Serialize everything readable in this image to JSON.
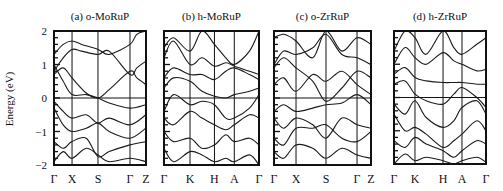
{
  "figure": {
    "ylabel": "Energy (eV)",
    "yticks": [
      {
        "value": 2,
        "label": "2"
      },
      {
        "value": 1,
        "label": "1"
      },
      {
        "value": 0,
        "label": "0"
      },
      {
        "value": -1,
        "label": "-1"
      },
      {
        "value": -2,
        "label": "-2"
      }
    ],
    "ylim": [
      -2,
      2
    ],
    "colors": {
      "line": "#1a1a1a",
      "frame": "#111111",
      "background": "#ffffff"
    }
  },
  "chart_data": [
    {
      "type": "line",
      "title": "(a) o-MoRuP",
      "xlabel": "",
      "ylabel": "Energy (eV)",
      "ylim": [
        -2,
        2
      ],
      "grid": false,
      "fermi_level": 0,
      "x_ticks": [
        "Γ",
        "X",
        "S",
        "Γ",
        "Z"
      ],
      "x_tick_positions": [
        0,
        0.196,
        0.478,
        0.826,
        1.0
      ],
      "series": [
        {
          "name": "band1",
          "x": [
            0,
            0.1,
            0.196,
            0.3,
            0.478,
            0.6,
            0.826,
            0.9,
            1
          ],
          "y": [
            1.3,
            1.6,
            1.7,
            1.6,
            1.45,
            1.3,
            1.6,
            1.9,
            2.0
          ]
        },
        {
          "name": "band2",
          "x": [
            0,
            0.1,
            0.196,
            0.3,
            0.478,
            0.6,
            0.826,
            0.9,
            1
          ],
          "y": [
            0.8,
            1.2,
            1.45,
            1.4,
            1.3,
            1.4,
            0.7,
            0.9,
            1.1
          ]
        },
        {
          "name": "band3",
          "x": [
            0,
            0.1,
            0.196,
            0.35,
            0.478,
            0.6,
            0.826,
            0.9,
            1
          ],
          "y": [
            0.7,
            0.9,
            0.6,
            0.15,
            0.0,
            0.25,
            0.8,
            0.6,
            0.4
          ]
        },
        {
          "name": "band4",
          "x": [
            0,
            0.1,
            0.196,
            0.35,
            0.478,
            0.6,
            0.826,
            1
          ],
          "y": [
            1.0,
            0.5,
            0.1,
            0.1,
            0.0,
            -0.15,
            -0.3,
            -0.2
          ]
        },
        {
          "name": "band5",
          "x": [
            0,
            0.1,
            0.196,
            0.35,
            0.478,
            0.6,
            0.826,
            1
          ],
          "y": [
            -0.1,
            -0.4,
            -0.6,
            -0.5,
            -0.75,
            -0.6,
            -0.8,
            -0.5
          ]
        },
        {
          "name": "band6",
          "x": [
            0,
            0.1,
            0.196,
            0.35,
            0.478,
            0.6,
            0.826,
            1
          ],
          "y": [
            -0.3,
            -0.8,
            -1.0,
            -0.9,
            -0.75,
            -1.0,
            -1.2,
            -0.9
          ]
        },
        {
          "name": "band7",
          "x": [
            0,
            0.1,
            0.196,
            0.35,
            0.478,
            0.6,
            0.826,
            1
          ],
          "y": [
            -1.3,
            -1.5,
            -1.3,
            -1.2,
            -1.75,
            -1.6,
            -1.4,
            -1.3
          ]
        },
        {
          "name": "band8",
          "x": [
            0,
            0.1,
            0.196,
            0.35,
            0.478,
            0.6,
            0.826,
            1
          ],
          "y": [
            -1.9,
            -1.6,
            -1.8,
            -1.5,
            -1.7,
            -1.9,
            -1.8,
            -1.9
          ]
        }
      ]
    },
    {
      "type": "line",
      "title": "(b) h-MoRuP",
      "xlabel": "",
      "ylabel": "",
      "ylim": [
        -2,
        2
      ],
      "grid": false,
      "fermi_level": 0,
      "x_ticks": [
        "Γ",
        "K",
        "H",
        "A",
        "Γ"
      ],
      "x_tick_positions": [
        0,
        0.274,
        0.531,
        0.74,
        1.0
      ],
      "series": [
        {
          "name": "band1",
          "x": [
            0,
            0.1,
            0.274,
            0.4,
            0.531,
            0.65,
            0.74,
            0.9,
            1
          ],
          "y": [
            1.5,
            1.8,
            1.4,
            2.0,
            1.6,
            1.2,
            1.0,
            1.4,
            2.0
          ]
        },
        {
          "name": "band2",
          "x": [
            0,
            0.1,
            0.274,
            0.4,
            0.531,
            0.65,
            0.74,
            0.9,
            1
          ],
          "y": [
            1.2,
            1.7,
            1.0,
            1.2,
            0.95,
            1.05,
            0.95,
            0.8,
            0.7
          ]
        },
        {
          "name": "band3",
          "x": [
            0,
            0.1,
            0.274,
            0.4,
            0.531,
            0.65,
            0.74,
            0.9,
            1
          ],
          "y": [
            0.6,
            0.9,
            0.7,
            0.7,
            0.55,
            0.8,
            0.9,
            0.7,
            0.55
          ]
        },
        {
          "name": "band4",
          "x": [
            0,
            0.1,
            0.274,
            0.4,
            0.531,
            0.65,
            0.74,
            0.9,
            1
          ],
          "y": [
            0.3,
            0.6,
            0.5,
            0.2,
            0.05,
            0.0,
            0.1,
            0.2,
            0.3
          ]
        },
        {
          "name": "band5",
          "x": [
            0,
            0.1,
            0.274,
            0.4,
            0.531,
            0.65,
            0.74,
            0.9,
            1
          ],
          "y": [
            -0.4,
            0.1,
            -0.2,
            -0.1,
            -0.2,
            -0.6,
            -0.6,
            -0.3,
            0.1
          ]
        },
        {
          "name": "band6",
          "x": [
            0,
            0.1,
            0.274,
            0.4,
            0.531,
            0.65,
            0.74,
            0.9,
            1
          ],
          "y": [
            -0.6,
            -0.8,
            -0.4,
            -0.6,
            -0.8,
            -0.95,
            -0.8,
            -0.5,
            -0.6
          ]
        },
        {
          "name": "band7",
          "x": [
            0,
            0.1,
            0.274,
            0.4,
            0.531,
            0.65,
            0.74,
            0.9,
            1
          ],
          "y": [
            -1.0,
            -1.3,
            -1.2,
            -1.5,
            -1.4,
            -1.1,
            -1.3,
            -1.2,
            -1.4
          ]
        },
        {
          "name": "band8",
          "x": [
            0,
            0.1,
            0.274,
            0.4,
            0.531,
            0.65,
            0.74,
            0.9,
            1
          ],
          "y": [
            -1.5,
            -1.9,
            -1.6,
            -1.7,
            -1.9,
            -1.8,
            -1.9,
            -1.7,
            -2.0
          ]
        }
      ]
    },
    {
      "type": "line",
      "title": "(c) o-ZrRuP",
      "xlabel": "",
      "ylabel": "",
      "ylim": [
        -2,
        2
      ],
      "grid": false,
      "fermi_level": 0,
      "x_ticks": [
        "Γ",
        "X",
        "S",
        "Γ",
        "Z"
      ],
      "x_tick_positions": [
        0,
        0.227,
        0.536,
        0.856,
        1.0
      ],
      "series": [
        {
          "name": "band1",
          "x": [
            0,
            0.1,
            0.227,
            0.4,
            0.536,
            0.7,
            0.856,
            1
          ],
          "y": [
            1.8,
            1.9,
            1.7,
            1.2,
            2.0,
            1.4,
            1.8,
            1.6
          ]
        },
        {
          "name": "band2",
          "x": [
            0,
            0.1,
            0.227,
            0.4,
            0.536,
            0.7,
            0.856,
            1
          ],
          "y": [
            1.0,
            1.4,
            1.3,
            1.5,
            1.9,
            1.3,
            1.2,
            1.0
          ]
        },
        {
          "name": "band3",
          "x": [
            0,
            0.1,
            0.227,
            0.4,
            0.536,
            0.7,
            0.856,
            1
          ],
          "y": [
            0.9,
            1.2,
            0.9,
            0.5,
            -0.1,
            0.3,
            0.8,
            0.6
          ]
        },
        {
          "name": "band4",
          "x": [
            0,
            0.1,
            0.227,
            0.4,
            0.536,
            0.7,
            0.856,
            1
          ],
          "y": [
            0.4,
            0.6,
            0.2,
            0.7,
            0.5,
            0.8,
            0.4,
            0.1
          ]
        },
        {
          "name": "band5",
          "x": [
            0,
            0.1,
            0.227,
            0.4,
            0.536,
            0.7,
            0.856,
            1
          ],
          "y": [
            -0.4,
            -0.2,
            -0.4,
            -0.3,
            -0.2,
            -0.15,
            0.1,
            -0.2
          ]
        },
        {
          "name": "band6",
          "x": [
            0,
            0.1,
            0.227,
            0.4,
            0.536,
            0.7,
            0.856,
            1
          ],
          "y": [
            -0.6,
            -0.9,
            -0.6,
            -0.8,
            -1.2,
            -0.6,
            -0.8,
            -0.9
          ]
        },
        {
          "name": "band7",
          "x": [
            0,
            0.1,
            0.227,
            0.4,
            0.536,
            0.7,
            0.856,
            1
          ],
          "y": [
            -1.2,
            -1.4,
            -0.9,
            -0.9,
            -0.8,
            -1.2,
            -1.3,
            -1.0
          ]
        },
        {
          "name": "band8",
          "x": [
            0,
            0.1,
            0.227,
            0.4,
            0.536,
            0.7,
            0.856,
            1
          ],
          "y": [
            -1.6,
            -1.8,
            -1.4,
            -1.5,
            -1.8,
            -1.5,
            -1.7,
            -1.8
          ]
        }
      ]
    },
    {
      "type": "line",
      "title": "(d) h-ZrRuP",
      "xlabel": "",
      "ylabel": "",
      "ylim": [
        -2,
        2
      ],
      "grid": false,
      "fermi_level": 0,
      "x_ticks": [
        "Γ",
        "K",
        "H",
        "A",
        "Γ"
      ],
      "x_tick_positions": [
        0,
        0.228,
        0.533,
        0.739,
        1.0
      ],
      "series": [
        {
          "name": "band1",
          "x": [
            0,
            0.12,
            0.228,
            0.35,
            0.533,
            0.65,
            0.739,
            0.9,
            1
          ],
          "y": [
            1.4,
            2.0,
            1.8,
            1.3,
            2.0,
            1.5,
            1.3,
            1.6,
            1.8
          ]
        },
        {
          "name": "band2",
          "x": [
            0,
            0.12,
            0.228,
            0.35,
            0.533,
            0.65,
            0.739,
            0.9,
            1
          ],
          "y": [
            1.0,
            1.5,
            1.2,
            1.0,
            1.35,
            1.1,
            1.0,
            0.8,
            0.85
          ]
        },
        {
          "name": "band3",
          "x": [
            0,
            0.12,
            0.228,
            0.35,
            0.533,
            0.65,
            0.739,
            0.9,
            1
          ],
          "y": [
            0.7,
            0.9,
            0.6,
            0.5,
            0.45,
            0.45,
            0.45,
            0.4,
            0.4
          ]
        },
        {
          "name": "band4",
          "x": [
            0,
            0.12,
            0.228,
            0.35,
            0.533,
            0.65,
            0.739,
            0.9,
            1
          ],
          "y": [
            0.4,
            0.5,
            0.1,
            -0.1,
            -0.2,
            0.1,
            0.3,
            0.0,
            -0.3
          ]
        },
        {
          "name": "band5",
          "x": [
            0,
            0.12,
            0.228,
            0.35,
            0.533,
            0.65,
            0.739,
            0.9,
            1
          ],
          "y": [
            -0.2,
            -0.5,
            -0.1,
            -0.6,
            -0.9,
            -0.7,
            -0.3,
            -0.1,
            -0.5
          ]
        },
        {
          "name": "band6",
          "x": [
            0,
            0.12,
            0.228,
            0.35,
            0.533,
            0.65,
            0.739,
            0.9,
            1
          ],
          "y": [
            -0.5,
            -1.0,
            -0.9,
            -1.1,
            -1.5,
            -1.3,
            -1.1,
            -0.7,
            -1.0
          ]
        },
        {
          "name": "band7",
          "x": [
            0,
            0.12,
            0.228,
            0.35,
            0.533,
            0.65,
            0.739,
            0.9,
            1
          ],
          "y": [
            -1.3,
            -1.5,
            -1.2,
            -1.4,
            -1.6,
            -1.8,
            -1.6,
            -1.3,
            -1.4
          ]
        },
        {
          "name": "band8",
          "x": [
            0,
            0.12,
            0.228,
            0.35,
            0.533,
            0.65,
            0.739,
            0.9,
            1
          ],
          "y": [
            -2.0,
            -1.7,
            -1.9,
            -1.8,
            -1.9,
            -2.0,
            -1.9,
            -1.8,
            -1.95
          ]
        }
      ]
    }
  ]
}
